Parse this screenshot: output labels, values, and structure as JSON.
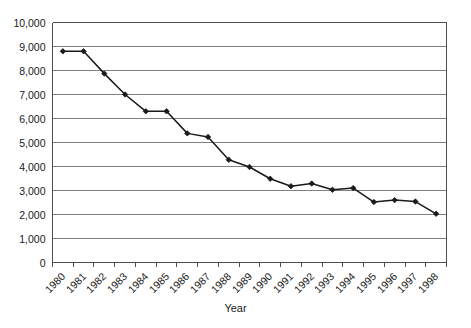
{
  "chart_data": {
    "type": "line",
    "title": "",
    "xlabel": "Year",
    "ylabel": "",
    "categories": [
      "1980",
      "1981",
      "1982",
      "1983",
      "1984",
      "1985",
      "1986",
      "1987",
      "1988",
      "1989",
      "1990",
      "1991",
      "1992",
      "1993",
      "1994",
      "1995",
      "1996",
      "1997",
      "1998"
    ],
    "values": [
      8800,
      8800,
      7870,
      7000,
      6300,
      6300,
      5380,
      5230,
      4280,
      3980,
      3490,
      3180,
      3290,
      3030,
      3100,
      2520,
      2600,
      2540,
      2030
    ],
    "series": [
      {
        "name": "",
        "values": [
          8800,
          8800,
          7870,
          7000,
          6300,
          6300,
          5380,
          5230,
          4280,
          3980,
          3490,
          3180,
          3290,
          3030,
          3100,
          2520,
          2600,
          2540,
          2030
        ]
      }
    ],
    "ylim": [
      0,
      10000
    ],
    "ytick_labels": [
      "0",
      "1,000",
      "2,000",
      "3,000",
      "4,000",
      "5,000",
      "6,000",
      "7,000",
      "8,000",
      "9,000",
      "10,000"
    ],
    "ytick_values": [
      0,
      1000,
      2000,
      3000,
      4000,
      5000,
      6000,
      7000,
      8000,
      9000,
      10000
    ],
    "grid": true,
    "grid_axis": "y",
    "legend": false,
    "legend_position": "none",
    "marker": "diamond",
    "line_color": "#1a1a1a",
    "marker_color": "#1a1a1a",
    "grid_color": "#808080",
    "axis_color": "#4d4d4d",
    "background_color": "#ffffff"
  }
}
